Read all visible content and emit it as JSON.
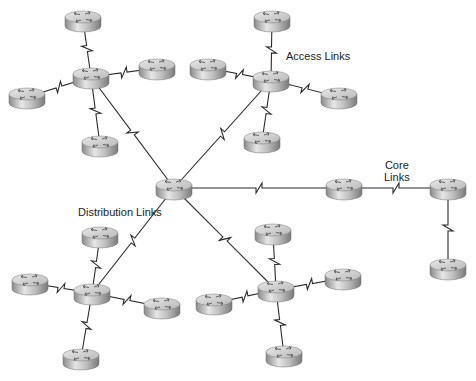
{
  "diagram": {
    "labels": {
      "access": "Access Links",
      "core_line1": "Core",
      "core_line2": "Links",
      "distribution": "Distribution Links"
    },
    "colors": {
      "link": "#2a2a2a",
      "router_top": "#d4d4d4",
      "router_side": "#9a9a9a",
      "background": "#ffffff"
    },
    "routers": [
      {
        "id": "center",
        "x": 174,
        "y": 188
      },
      {
        "id": "hub-tl",
        "x": 91,
        "y": 77
      },
      {
        "id": "tl-top",
        "x": 83,
        "y": 20
      },
      {
        "id": "tl-right",
        "x": 157,
        "y": 68
      },
      {
        "id": "tl-left",
        "x": 27,
        "y": 97
      },
      {
        "id": "tl-bottom",
        "x": 100,
        "y": 145
      },
      {
        "id": "hub-tr",
        "x": 271,
        "y": 80
      },
      {
        "id": "tr-top",
        "x": 272,
        "y": 20
      },
      {
        "id": "tr-left",
        "x": 208,
        "y": 68
      },
      {
        "id": "tr-right",
        "x": 339,
        "y": 97
      },
      {
        "id": "tr-bottom",
        "x": 262,
        "y": 141
      },
      {
        "id": "core-1",
        "x": 344,
        "y": 188
      },
      {
        "id": "core-2",
        "x": 448,
        "y": 188
      },
      {
        "id": "core-3",
        "x": 448,
        "y": 268
      },
      {
        "id": "hub-bl",
        "x": 92,
        "y": 293
      },
      {
        "id": "bl-top",
        "x": 100,
        "y": 236
      },
      {
        "id": "bl-left",
        "x": 30,
        "y": 283
      },
      {
        "id": "bl-right",
        "x": 162,
        "y": 307
      },
      {
        "id": "bl-bottom",
        "x": 81,
        "y": 358
      },
      {
        "id": "hub-br",
        "x": 276,
        "y": 290
      },
      {
        "id": "br-top",
        "x": 273,
        "y": 233
      },
      {
        "id": "br-left",
        "x": 214,
        "y": 303
      },
      {
        "id": "br-right",
        "x": 343,
        "y": 278
      },
      {
        "id": "br-bottom",
        "x": 284,
        "y": 355
      }
    ],
    "links": [
      {
        "from": "center",
        "to": "hub-tl",
        "type": "distribution"
      },
      {
        "from": "center",
        "to": "hub-tr",
        "type": "distribution"
      },
      {
        "from": "center",
        "to": "hub-bl",
        "type": "distribution"
      },
      {
        "from": "center",
        "to": "hub-br",
        "type": "distribution"
      },
      {
        "from": "center",
        "to": "core-1",
        "type": "core"
      },
      {
        "from": "core-1",
        "to": "core-2",
        "type": "core"
      },
      {
        "from": "core-2",
        "to": "core-3",
        "type": "core"
      },
      {
        "from": "hub-tl",
        "to": "tl-top",
        "type": "access"
      },
      {
        "from": "hub-tl",
        "to": "tl-right",
        "type": "access"
      },
      {
        "from": "hub-tl",
        "to": "tl-left",
        "type": "access"
      },
      {
        "from": "hub-tl",
        "to": "tl-bottom",
        "type": "access"
      },
      {
        "from": "hub-tr",
        "to": "tr-top",
        "type": "access"
      },
      {
        "from": "hub-tr",
        "to": "tr-left",
        "type": "access"
      },
      {
        "from": "hub-tr",
        "to": "tr-right",
        "type": "access"
      },
      {
        "from": "hub-tr",
        "to": "tr-bottom",
        "type": "access"
      },
      {
        "from": "hub-bl",
        "to": "bl-top",
        "type": "access"
      },
      {
        "from": "hub-bl",
        "to": "bl-left",
        "type": "access"
      },
      {
        "from": "hub-bl",
        "to": "bl-right",
        "type": "access"
      },
      {
        "from": "hub-bl",
        "to": "bl-bottom",
        "type": "access"
      },
      {
        "from": "hub-br",
        "to": "br-top",
        "type": "access"
      },
      {
        "from": "hub-br",
        "to": "br-left",
        "type": "access"
      },
      {
        "from": "hub-br",
        "to": "br-right",
        "type": "access"
      },
      {
        "from": "hub-br",
        "to": "br-bottom",
        "type": "access"
      }
    ]
  }
}
